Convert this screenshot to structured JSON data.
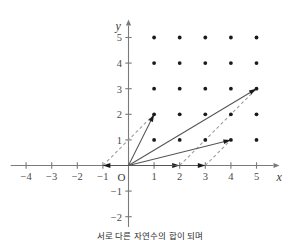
{
  "figure": {
    "caption": "서로 다른 자연수의 합이 되며"
  },
  "chart_data": {
    "type": "scatter",
    "title": "",
    "xlabel": "x",
    "ylabel": "y",
    "xlim": [
      -4.6,
      5.9
    ],
    "ylim": [
      -2.4,
      5.7
    ],
    "grid": false,
    "legend": null,
    "x_ticks": [
      -4,
      -3,
      -2,
      -1,
      1,
      2,
      3,
      4,
      5
    ],
    "y_ticks": [
      5,
      4,
      3,
      2,
      1,
      -1,
      -2
    ],
    "x_tick_labels": [
      "-4",
      "-3",
      "-2",
      "-1",
      "1",
      "2",
      "3",
      "4",
      "5"
    ],
    "y_tick_labels": [
      "5",
      "4",
      "3",
      "2",
      "1",
      "-1",
      "-2"
    ],
    "origin_label": "O",
    "lattice_points": [
      [
        1,
        1
      ],
      [
        2,
        1
      ],
      [
        3,
        1
      ],
      [
        4,
        1
      ],
      [
        5,
        1
      ],
      [
        1,
        2
      ],
      [
        2,
        2
      ],
      [
        3,
        2
      ],
      [
        4,
        2
      ],
      [
        5,
        2
      ],
      [
        1,
        3
      ],
      [
        2,
        3
      ],
      [
        3,
        3
      ],
      [
        4,
        3
      ],
      [
        5,
        3
      ],
      [
        1,
        4
      ],
      [
        2,
        4
      ],
      [
        3,
        4
      ],
      [
        4,
        4
      ],
      [
        5,
        4
      ],
      [
        1,
        5
      ],
      [
        2,
        5
      ],
      [
        3,
        5
      ],
      [
        4,
        5
      ],
      [
        5,
        5
      ]
    ],
    "vectors_solid": [
      {
        "from": [
          0,
          0
        ],
        "to": [
          1,
          2
        ],
        "arrow": true
      },
      {
        "from": [
          0,
          0
        ],
        "to": [
          5,
          3
        ],
        "arrow": true
      },
      {
        "from": [
          0,
          0
        ],
        "to": [
          4,
          1
        ],
        "arrow": true
      },
      {
        "from": [
          0,
          0
        ],
        "to": [
          -1,
          0
        ],
        "arrow": true
      },
      {
        "from": [
          0,
          0
        ],
        "to": [
          2,
          0
        ],
        "arrow": true
      },
      {
        "from": [
          0,
          0
        ],
        "to": [
          3,
          0
        ],
        "arrow": true
      }
    ],
    "vectors_dashed": [
      {
        "from": [
          -1,
          0
        ],
        "to": [
          1,
          2
        ],
        "arrow": false
      },
      {
        "from": [
          2,
          0
        ],
        "to": [
          5,
          3
        ],
        "arrow": false
      },
      {
        "from": [
          3,
          0
        ],
        "to": [
          4,
          1
        ],
        "arrow": false
      }
    ]
  }
}
